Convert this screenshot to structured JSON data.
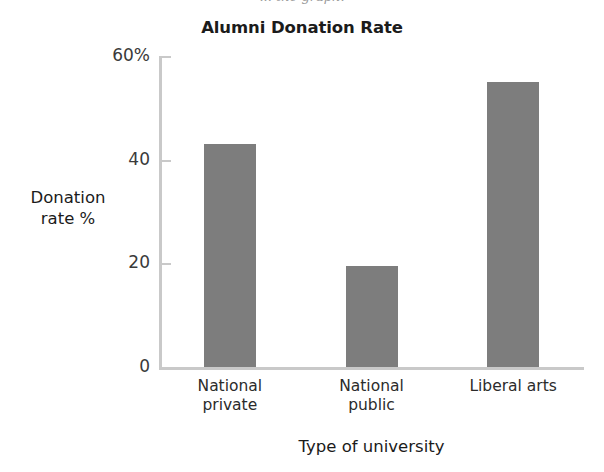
{
  "cropped_caption": "... the graph.",
  "chart_data": {
    "type": "bar",
    "title": "Alumni Donation Rate",
    "xlabel": "Type of university",
    "ylabel": "Donation\nrate %",
    "categories": [
      "National\nprivate",
      "National\npublic",
      "Liberal arts"
    ],
    "values": [
      43,
      19.5,
      55
    ],
    "ylim": [
      0,
      60
    ],
    "yticks": [
      0,
      20,
      40,
      60
    ],
    "ytick_labels": [
      "0",
      "20",
      "40",
      "60%"
    ],
    "grid": false,
    "legend": null,
    "bar_color": "#7d7d7d",
    "axis_color": "#c9c9c9",
    "text_color": "#1b1b1b"
  }
}
